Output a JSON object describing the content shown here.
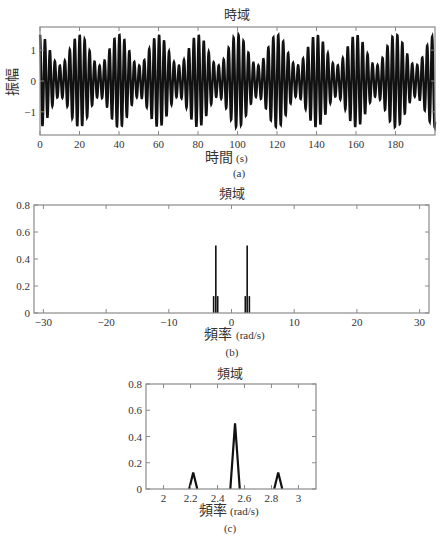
{
  "chart_data": [
    {
      "id": "a",
      "type": "line",
      "title": "時域",
      "xlabel": "時間 (s)",
      "ylabel": "振幅",
      "caption": "(a)",
      "xlim": [
        0,
        200
      ],
      "ylim": [
        -1.75,
        1.75
      ],
      "xticks": [
        0,
        20,
        40,
        60,
        80,
        100,
        120,
        140,
        160,
        180
      ],
      "yticks": [
        -1,
        0,
        1
      ],
      "grid": false,
      "signal": {
        "description": "Amplitude-modulated cosine: x(t) = cos(2.5t) * (1 + 0.5*cos(0.314t))",
        "carrier_rad_per_s": 2.5,
        "modulation_rad_per_s": 0.314,
        "modulation_depth": 0.5,
        "max_amplitude": 1.5,
        "envelope_period_s": 20
      },
      "plot_box": {
        "left": 40,
        "top": 27,
        "right": 435,
        "bottom": 135
      }
    },
    {
      "id": "b",
      "type": "bar",
      "title": "頻域",
      "xlabel": "頻率 (rad/s)",
      "ylabel": "",
      "caption": "(b)",
      "xlim": [
        -31.5,
        31.5
      ],
      "ylim": [
        0,
        0.8
      ],
      "xticks": [
        -30,
        -20,
        -10,
        0,
        10,
        20,
        30
      ],
      "yticks": [
        0,
        0.2,
        0.4,
        0.6,
        0.8
      ],
      "grid": false,
      "x": [
        -2.85,
        -2.5,
        -2.2,
        2.2,
        2.5,
        2.85
      ],
      "values": [
        0.125,
        0.5,
        0.125,
        0.125,
        0.5,
        0.125
      ],
      "plot_box": {
        "left": 34,
        "top": 205,
        "right": 429,
        "bottom": 313
      }
    },
    {
      "id": "c",
      "type": "line",
      "title": "頻域",
      "xlabel": "頻率 (rad/s)",
      "ylabel": "",
      "caption": "(c)",
      "xlim": [
        1.87,
        3.13
      ],
      "ylim": [
        0,
        0.8
      ],
      "xticks": [
        2,
        2.2,
        2.4,
        2.6,
        2.8,
        3
      ],
      "xtick_labels": [
        "2",
        "2.2",
        "2.4",
        "2.6",
        "2.8",
        "3"
      ],
      "yticks": [
        0,
        0.2,
        0.4,
        0.6,
        0.8
      ],
      "grid": false,
      "x": [
        2.22,
        2.53,
        2.85
      ],
      "values": [
        0.125,
        0.5,
        0.125
      ],
      "peak_halfwidth": [
        0.03,
        0.035,
        0.03
      ],
      "plot_box": {
        "left": 146,
        "top": 384,
        "right": 316,
        "bottom": 489
      }
    }
  ],
  "labels": {
    "a": {
      "title": "時域",
      "xlabel_cjk": "時間",
      "xlabel_unit": "(s)",
      "ylabel": "振幅",
      "caption": "(a)"
    },
    "b": {
      "title": "頻域",
      "xlabel_cjk": "頻率",
      "xlabel_unit": "(rad/s)",
      "caption": "(b)"
    },
    "c": {
      "title": "頻域",
      "xlabel_cjk": "頻率",
      "xlabel_unit": "(rad/s)",
      "caption": "(c)"
    }
  },
  "colors": {
    "line": "#111111",
    "axis": "#8a8a8a",
    "text": "#333333"
  }
}
